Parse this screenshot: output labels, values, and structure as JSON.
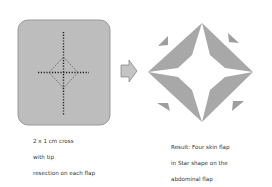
{
  "left_panel": {
    "caption_lines": [
      "2 x 1 cm cross",
      "with tip",
      "resection on each flap"
    ],
    "fill_color": "#bdbdbd",
    "border_color": "#9a9a9a"
  },
  "arrow": {
    "fill_color": "#c4c4c4",
    "stroke_color": "#8a8a8a"
  },
  "right_panel": {
    "caption_lines": [
      "Result: Four skin flap",
      "in Star shape on the",
      "abdominal flap"
    ],
    "flap_color": "#a8a8a8"
  }
}
